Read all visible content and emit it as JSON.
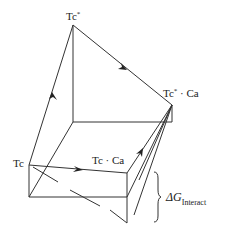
{
  "diagram": {
    "type": "thermodynamic-cycle-box",
    "colors": {
      "line": "#333333",
      "background": "#ffffff"
    },
    "labels": {
      "tc": "Tc",
      "tc_star": "Tc",
      "tc_star_sup": "*",
      "tc_ca": "Tc · Ca",
      "tc_star_ca_main": "Tc",
      "tc_star_ca_sup": "*",
      "tc_star_ca_tail": " · Ca",
      "delta_g": "ΔG",
      "delta_g_sub": "Interact"
    }
  }
}
